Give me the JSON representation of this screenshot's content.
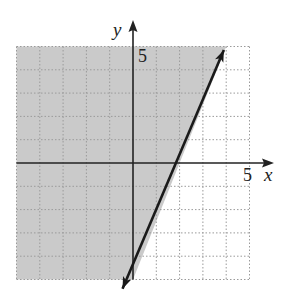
{
  "chart_data": {
    "type": "line",
    "title": "",
    "subtitle": "",
    "xlabel": "x",
    "ylabel": "y",
    "xlim": [
      -5,
      5
    ],
    "ylim": [
      -5,
      5
    ],
    "grid": true,
    "grid_style": "dotted",
    "grid_step": 1,
    "tick_labels": {
      "x": [
        "5"
      ],
      "y": [
        "5"
      ]
    },
    "series": [
      {
        "name": "boundary line",
        "equation": "y = 2.5x - 5",
        "style": "solid",
        "arrows": "both",
        "points": [
          {
            "x": 0,
            "y": -5
          },
          {
            "x": 2,
            "y": 0
          },
          {
            "x": 4,
            "y": 5
          }
        ],
        "arrow_endpoints": [
          {
            "x": -0.45,
            "y": -5.4
          },
          {
            "x": 3.9,
            "y": 4.85
          }
        ]
      }
    ],
    "shaded_region": {
      "inequality": "y >= 2.5x - 5",
      "side": "left/above line",
      "color": "#c8c8c8"
    },
    "legend": null
  },
  "axes": {
    "x_label": "x",
    "y_label": "y",
    "x_tick_label": "5",
    "y_tick_label": "5"
  },
  "colors": {
    "shade": "#cacaca",
    "grid": "#9a9a9a",
    "axis": "#222222",
    "line": "#1a1a1a"
  }
}
